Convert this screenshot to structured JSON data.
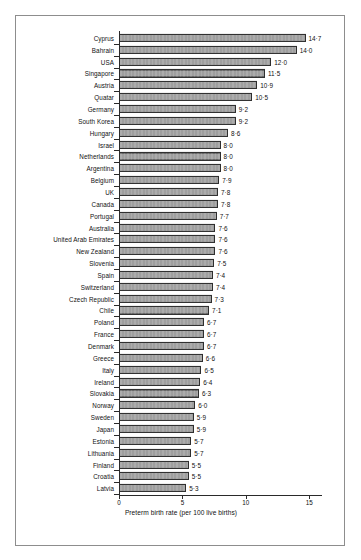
{
  "figure": {
    "panel_name": "bar-chart-panel"
  },
  "chart_data": {
    "type": "bar",
    "orientation": "horizontal",
    "title": "",
    "subtitle": "",
    "xlabel": "Preterm birth rate (per 100 live births)",
    "ylabel": "",
    "xlim": [
      0,
      16
    ],
    "xticks": [
      0,
      5,
      10,
      15
    ],
    "xtick_labels": [
      "0",
      "5",
      "10",
      "15"
    ],
    "grid": false,
    "legend": null,
    "decimal_separator": "·",
    "bar_color": "#7b7b7b",
    "bar_edge_color": "#2e2e2e",
    "categories": [
      "Cyprus",
      "Bahrain",
      "USA",
      "Singapore",
      "Austria",
      "Quatar",
      "Germany",
      "South Korea",
      "Hungary",
      "Israel",
      "Netherlands",
      "Argentina",
      "Belgium",
      "UK",
      "Canada",
      "Portugal",
      "Australia",
      "United Arab Emirates",
      "New Zealand",
      "Slovenia",
      "Spain",
      "Switzerland",
      "Czech Republic",
      "Chile",
      "Poland",
      "France",
      "Denmark",
      "Greece",
      "Italy",
      "Ireland",
      "Slovakia",
      "Norway",
      "Sweden",
      "Japan",
      "Estonia",
      "Lithuania",
      "Finland",
      "Croatia",
      "Latvia"
    ],
    "values": [
      14.7,
      14.0,
      12.0,
      11.5,
      10.9,
      10.5,
      9.2,
      9.2,
      8.6,
      8.0,
      8.0,
      8.0,
      7.9,
      7.8,
      7.8,
      7.7,
      7.6,
      7.6,
      7.6,
      7.5,
      7.4,
      7.4,
      7.3,
      7.1,
      6.7,
      6.7,
      6.7,
      6.6,
      6.5,
      6.4,
      6.3,
      6.0,
      5.9,
      5.9,
      5.7,
      5.7,
      5.5,
      5.5,
      5.3
    ],
    "value_labels": [
      "14·7",
      "14·0",
      "12·0",
      "11·5",
      "10·9",
      "10·5",
      "9·2",
      "9·2",
      "8·6",
      "8·0",
      "8·0",
      "8·0",
      "7·9",
      "7·8",
      "7·8",
      "7·7",
      "7·6",
      "7·6",
      "7·6",
      "7·5",
      "7·4",
      "7·4",
      "7·3",
      "7·1",
      "6·7",
      "6·7",
      "6·7",
      "6·6",
      "6·5",
      "6·4",
      "6·3",
      "6·0",
      "5·9",
      "5·9",
      "5·7",
      "5·7",
      "5·5",
      "5·5",
      "5·3"
    ]
  }
}
